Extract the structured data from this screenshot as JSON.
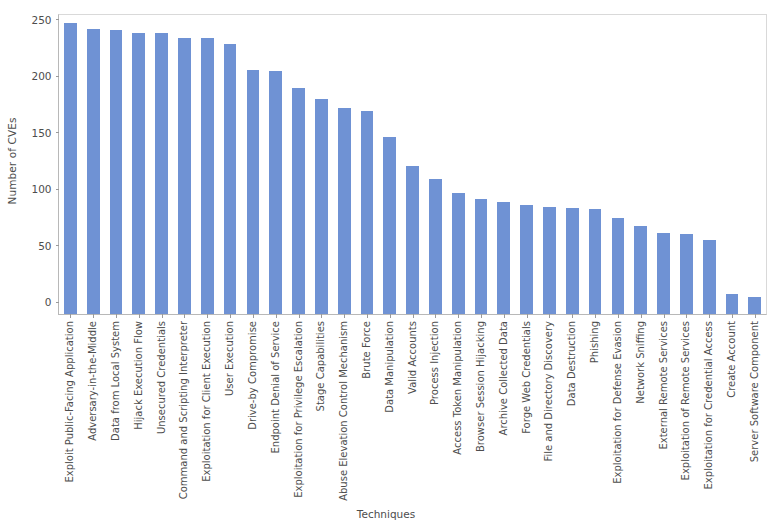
{
  "chart_data": {
    "type": "bar",
    "title": "",
    "xlabel": "Techniques",
    "ylabel": "Number of CVEs",
    "ylim": [
      0,
      265
    ],
    "yticks": [
      0,
      50,
      100,
      150,
      200,
      250
    ],
    "grid": false,
    "legend": null,
    "bar_color": "#6f92d4",
    "categories": [
      "Exploit Public-Facing Application",
      "Adversary-in-the-Middle",
      "Data from Local System",
      "Hijack Execution Flow",
      "Unsecured Credentials",
      "Command and Scripting Interpreter",
      "Exploitation for Client Execution",
      "User Execution",
      "Drive-by Compromise",
      "Endpoint Denial of Service",
      "Exploitation for Privilege Escalation",
      "Stage Capabilities",
      "Abuse Elevation Control Mechanism",
      "Brute Force",
      "Data Manipulation",
      "Valid Accounts",
      "Process Injection",
      "Access Token Manipulation",
      "Browser Session Hijacking",
      "Archive Collected Data",
      "Forge Web Credentials",
      "File and Directory Discovery",
      "Data Destruction",
      "Phishing",
      "Exploitation for Defense Evasion",
      "Network Sniffing",
      "External Remote Services",
      "Exploitation of Remote Services",
      "Exploitation for Credential Access",
      "Create Account",
      "Server Software Component"
    ],
    "values": [
      258,
      253,
      252,
      249,
      249,
      245,
      245,
      239,
      216,
      215,
      200,
      191,
      183,
      180,
      157,
      131,
      120,
      107,
      102,
      99,
      97,
      95,
      94,
      93,
      85,
      78,
      72,
      71,
      66,
      18,
      15
    ]
  }
}
